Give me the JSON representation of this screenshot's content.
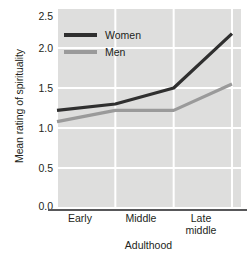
{
  "chart_data": {
    "type": "line",
    "title": "",
    "xlabel": "Adulthood",
    "ylabel": "Mean rating of spirituality",
    "categories": [
      "Early",
      "Middle",
      "Late middle",
      "Late"
    ],
    "category_lines": [
      [
        "Early"
      ],
      [
        "Middle"
      ],
      [
        "Late",
        "middle"
      ],
      [
        "Late"
      ]
    ],
    "yticks": [
      "0.0",
      "0.5",
      "1.0",
      "1.5",
      "2.0",
      "2.5"
    ],
    "ytick_values": [
      0.0,
      0.5,
      1.0,
      1.5,
      2.0,
      2.5
    ],
    "ylim": [
      0.0,
      2.5
    ],
    "grid": true,
    "grid_color": "#ffffff",
    "plot_background": "#dededd",
    "legend_position": "top-left",
    "series": [
      {
        "name": "Women",
        "color": "#2f2f2f",
        "values": [
          1.22,
          1.3,
          1.5,
          2.18
        ]
      },
      {
        "name": "Men",
        "color": "#9a9a9a",
        "values": [
          1.08,
          1.22,
          1.22,
          1.55
        ]
      }
    ]
  },
  "legend": {
    "items": [
      {
        "label": "Women",
        "color": "#2f2f2f"
      },
      {
        "label": "Men",
        "color": "#9a9a9a"
      }
    ]
  }
}
